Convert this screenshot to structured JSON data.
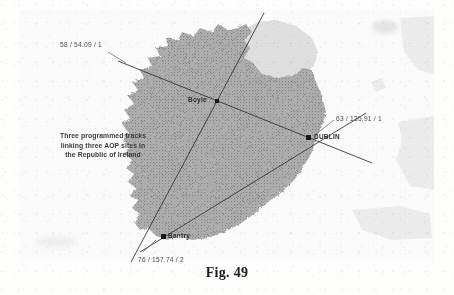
{
  "figure": {
    "caption": "Fig. 49",
    "annotation_lines": [
      "Three programmed tracks",
      "linking three AOP sites in",
      "the Republic of Ireland"
    ]
  },
  "map": {
    "region": "Republic of Ireland",
    "sites": [
      {
        "name": "Boyle",
        "x": 217,
        "y": 101,
        "label_dx": -27,
        "label_dy": -4
      },
      {
        "name": "DUBLIN",
        "x": 308,
        "y": 137,
        "label_dx": 6,
        "label_dy": -3
      },
      {
        "name": "Bantry",
        "x": 163,
        "y": 236,
        "label_dx": 6,
        "label_dy": -3
      }
    ],
    "tracks": [
      {
        "id": "track-1",
        "from": "Boyle",
        "to": "DUBLIN",
        "label": "58 / 54.09 / 1",
        "label_x": 60,
        "label_y": 42,
        "heading_deg": 58,
        "distance_nm": 54.09,
        "leg": 1
      },
      {
        "id": "track-2",
        "from": "Bantry",
        "to": "DUBLIN",
        "label": "63 / 135.91 / 1",
        "label_x": 336,
        "label_y": 116,
        "heading_deg": 63,
        "distance_nm": 135.91,
        "leg": 1
      },
      {
        "id": "track-3",
        "from": "Bantry",
        "to": "Boyle",
        "label": "76 / 157.74 / 2",
        "label_x": 138,
        "label_y": 258,
        "heading_deg": 76,
        "distance_nm": 157.74,
        "leg": 2
      }
    ]
  },
  "colors": {
    "track_line": "#2a2a2a",
    "site_marker": "#1a1a1a",
    "republic_fill": "#a8a8a8",
    "northern_fill": "#dcdcdc",
    "sea": "#fdfdfd",
    "caption_text": "#1c1c1c"
  }
}
